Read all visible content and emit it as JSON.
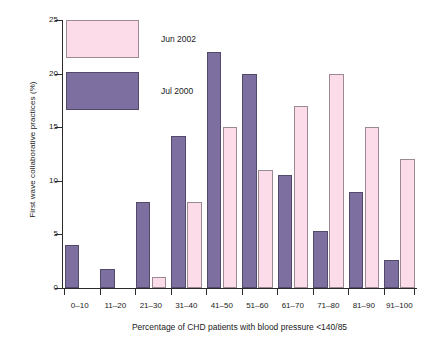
{
  "chart_data": {
    "type": "bar",
    "title": "",
    "xlabel": "Percentage of CHD patients with blood pressure <140/85",
    "ylabel": "First wave collaborative practices (%)",
    "categories": [
      "0–10",
      "11–20",
      "21–30",
      "31–40",
      "41–50",
      "51–60",
      "61–70",
      "71–80",
      "81–90",
      "91–100"
    ],
    "ylim": [
      0,
      25
    ],
    "yticks": [
      0,
      5,
      10,
      15,
      20,
      25
    ],
    "grid": false,
    "legend_position": "top-left",
    "series": [
      {
        "name": "Jun 2002",
        "color": "#fbdce8",
        "border_color": "#9b8a93",
        "values": [
          0,
          0,
          1,
          8,
          15,
          11,
          17,
          20,
          15,
          12
        ]
      },
      {
        "name": "Jul 2000",
        "color": "#7d6fa0",
        "border_color": "#53496b",
        "values": [
          4,
          1.8,
          8,
          14.2,
          22,
          20,
          10.5,
          5.3,
          9,
          2.6
        ]
      }
    ]
  },
  "legend": {
    "items": [
      {
        "label": "Jun 2002",
        "swatch": "pink"
      },
      {
        "label": "Jul 2000",
        "swatch": "purple"
      }
    ]
  },
  "axes": {
    "y_tick_labels": [
      "0",
      "5",
      "10",
      "15",
      "20",
      "25"
    ],
    "x_tick_labels": [
      "0–10",
      "11–20",
      "21–30",
      "31–40",
      "41–50",
      "51–60",
      "61–70",
      "71–80",
      "81–90",
      "91–100"
    ]
  }
}
